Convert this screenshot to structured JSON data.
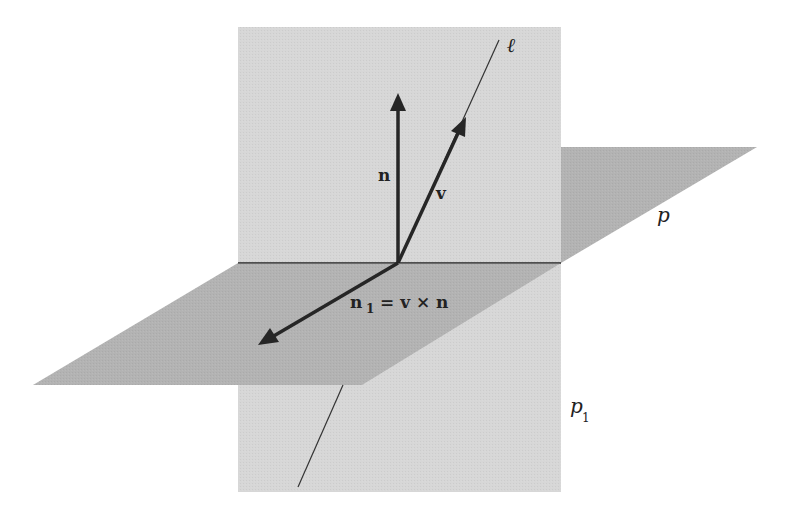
{
  "diagram": {
    "colors": {
      "vertical_plane": "#d7d7d7",
      "horizontal_plane": "#b3b3b3",
      "vectors": "#262626",
      "line": "#333333",
      "background": "#ffffff"
    },
    "labels": {
      "line": "ℓ",
      "normal": "n",
      "direction": "v",
      "plane": "p",
      "plane_sub": "p",
      "plane_sub_index": "1",
      "cross_n": "n",
      "cross_index": "1",
      "cross_eq": "= v × n"
    },
    "elements": [
      {
        "id": "plane-p1",
        "type": "vertical-plane",
        "label": "p₁"
      },
      {
        "id": "plane-p",
        "type": "horizontal-plane",
        "label": "p"
      },
      {
        "id": "line-l",
        "type": "line",
        "label": "ℓ"
      },
      {
        "id": "vector-n",
        "type": "vector",
        "label": "n"
      },
      {
        "id": "vector-v",
        "type": "vector",
        "label": "v"
      },
      {
        "id": "vector-n1",
        "type": "vector",
        "label": "n₁ = v × n"
      }
    ]
  }
}
